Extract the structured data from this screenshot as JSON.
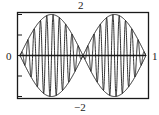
{
  "chart_data": {
    "type": "line",
    "title": "",
    "xlabel": "",
    "ylabel": "",
    "xlim": [
      0,
      1
    ],
    "ylim": [
      -2,
      2
    ],
    "tick_labels": {
      "x_min": "0",
      "x_max": "1",
      "y_max": "2",
      "y_min": "−2"
    },
    "grid": false,
    "series": [
      {
        "name": "upper envelope",
        "expr": "2*sin(2*pi*x)",
        "note": "abs envelope +"
      },
      {
        "name": "lower envelope",
        "expr": "-2*sin(2*pi*x)",
        "note": "abs envelope -"
      },
      {
        "name": "modulated signal",
        "expr": "2*sin(2*pi*x)*sin(40*pi*x)"
      },
      {
        "name": "x axis",
        "expr": "0"
      }
    ]
  },
  "labels": {
    "top": "2",
    "bottom": "−2",
    "left": "0",
    "right": "1"
  },
  "colors": {
    "line": "#1a1a1a",
    "frame": "#1a1a1a"
  }
}
